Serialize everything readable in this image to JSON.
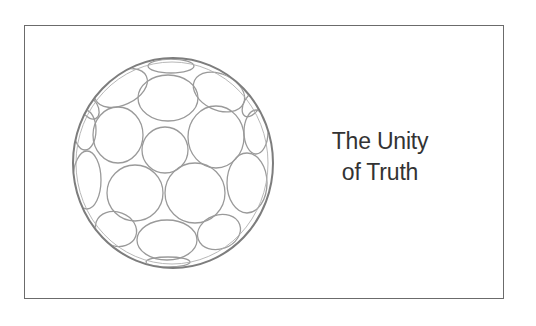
{
  "slide": {
    "title_lines": [
      "The Unity",
      "of Truth"
    ],
    "graphic": "sphere-of-circles-icon",
    "colors": {
      "border": "#6b6b6b",
      "text": "#333333",
      "sphere_stroke": "#8a8a8a",
      "background": "#ffffff"
    }
  }
}
